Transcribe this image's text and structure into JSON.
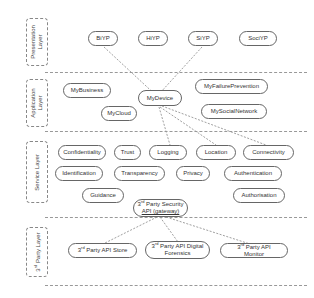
{
  "diagram": {
    "layers": [
      {
        "id": "presentation",
        "label": "Presentation Layer"
      },
      {
        "id": "application",
        "label": "Application Layer"
      },
      {
        "id": "service",
        "label": "Service Layer"
      },
      {
        "id": "third_party",
        "label": "3rd Party Layer"
      }
    ],
    "presentation_nodes": [
      "BiYP",
      "HiYP",
      "SiYP",
      "SociYP"
    ],
    "application_nodes": [
      "MyBusiness",
      "MyDevice",
      "MyFailurePrevention",
      "MyCloud",
      "MySocialNetwork"
    ],
    "service_nodes": [
      "Confidentiality",
      "Trust",
      "Logging",
      "Location",
      "Connectivity",
      "Identification",
      "Transparency",
      "Privacy",
      "Authentication",
      "Guidance",
      "Authorisation"
    ],
    "gateway": {
      "sup": "rd",
      "pre": "3",
      "line1": " Party Security",
      "line2": "API (gateway)"
    },
    "third_party_nodes": [
      {
        "pre": "3",
        "sup": "rd",
        "text": " Party API Store"
      },
      {
        "pre": "3",
        "sup": "rd",
        "text": " Party API Digital Forensics"
      },
      {
        "pre": "3",
        "sup": "rd",
        "text": " Party API Monitor"
      }
    ],
    "connections": [
      [
        "BiYP",
        "MyDevice"
      ],
      [
        "SiYP",
        "MyDevice"
      ],
      [
        "MyDevice",
        "Logging"
      ],
      [
        "MyDevice",
        "Location"
      ],
      [
        "MyDevice",
        "Connectivity"
      ],
      [
        "3rd Party Security API (gateway)",
        "3rd Party API Store"
      ],
      [
        "3rd Party Security API (gateway)",
        "3rd Party API Digital Forensics"
      ],
      [
        "3rd Party Security API (gateway)",
        "3rd Party API Monitor"
      ]
    ]
  }
}
